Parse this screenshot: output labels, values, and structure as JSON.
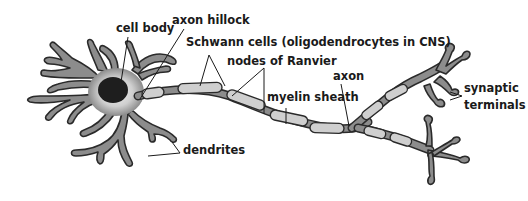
{
  "diagram": {
    "type": "neuron-anatomy",
    "colors": {
      "background": "#ffffff",
      "cell_fill": "#8c8c8c",
      "cell_body_center": "#e8e8e8",
      "nucleus": "#1e1e1e",
      "myelin_fill": "#cfcfcf",
      "outline": "#2a2a2a",
      "text": "#1a1a1a"
    },
    "labels": {
      "cell_body": "cell body",
      "axon_hillock": "axon hillock",
      "schwann_cells": "Schwann cells (oligodendrocytes in CNS)",
      "nodes_of_ranvier": "nodes of Ranvier",
      "myelin_sheath": "myelin sheath",
      "axon": "axon",
      "synaptic_terminals_line1": "synaptic",
      "synaptic_terminals_line2": "terminals",
      "dendrites": "dendrites"
    }
  }
}
